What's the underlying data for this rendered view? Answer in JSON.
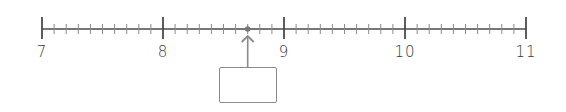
{
  "number_line": {
    "start": 7,
    "end": 11,
    "major_labels": [
      "7",
      "8",
      "9",
      "10",
      "11"
    ],
    "minor_divisions_per_unit": 10,
    "marked_point": 8.7,
    "answer_box_value": "",
    "colors": {
      "line": "#4a4a4a",
      "minor_tick": "#8a8a8a",
      "point": "#777777",
      "arrow": "#8a8a8a",
      "box_border": "#8a8a8a",
      "label": "#3a3a3a"
    }
  },
  "layout": {
    "x_start": 42,
    "px_per_unit": 121,
    "line_y": 29,
    "box": {
      "left": 219,
      "top": 67,
      "width": 58,
      "height": 36
    }
  }
}
